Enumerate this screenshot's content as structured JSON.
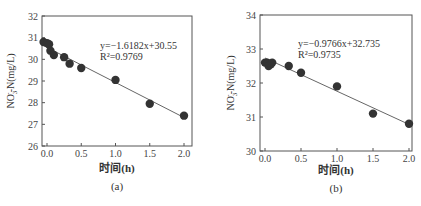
{
  "chart_data": [
    {
      "type": "scatter",
      "panel_label": "(a)",
      "xlabel": "时间(h)",
      "ylabel": "NO3--N(mg/L)",
      "ylabel_parts": {
        "pre": "NO",
        "sub": "3",
        "sup": "-",
        "post": "-N(mg/L)"
      },
      "xlim": [
        -0.1,
        2.1
      ],
      "ylim": [
        26,
        32
      ],
      "xticks": [
        "0.0",
        "0.5",
        "1.0",
        "1.5",
        "2.0"
      ],
      "yticks": [
        "26",
        "27",
        "28",
        "29",
        "30",
        "31",
        "32"
      ],
      "grid": false,
      "fit": {
        "slope": -1.6182,
        "intercept": 30.55,
        "equation": "y=−1.6182x+30.55",
        "r2": "R²=0.9769"
      },
      "x": [
        -0.05,
        0.0,
        0.03,
        0.05,
        0.1,
        0.25,
        0.33,
        0.5,
        1.0,
        1.5,
        2.0
      ],
      "y": [
        30.8,
        30.75,
        30.7,
        30.4,
        30.2,
        30.1,
        29.8,
        29.6,
        29.05,
        27.95,
        27.4
      ]
    },
    {
      "type": "scatter",
      "panel_label": "(b)",
      "xlabel": "时间(h)",
      "ylabel": "NO3--N(mg/L)",
      "ylabel_parts": {
        "pre": "NO",
        "sub": "3",
        "sup": "-",
        "post": "-N(mg/L)"
      },
      "xlim": [
        -0.05,
        2.05
      ],
      "ylim": [
        30,
        34
      ],
      "xticks": [
        "0.0",
        "0.5",
        "1.0",
        "1.5",
        "2.0"
      ],
      "yticks": [
        "30",
        "31",
        "32",
        "33",
        "34"
      ],
      "grid": false,
      "fit": {
        "slope": -0.9766,
        "intercept": 32.735,
        "equation": "y=−0.9766x+32.735",
        "r2": "R²=0.9735"
      },
      "x": [
        0.0,
        0.03,
        0.05,
        0.08,
        0.1,
        0.33,
        0.5,
        1.0,
        1.5,
        2.0
      ],
      "y": [
        32.6,
        32.6,
        32.5,
        32.55,
        32.6,
        32.5,
        32.3,
        31.9,
        31.1,
        30.8
      ]
    }
  ]
}
